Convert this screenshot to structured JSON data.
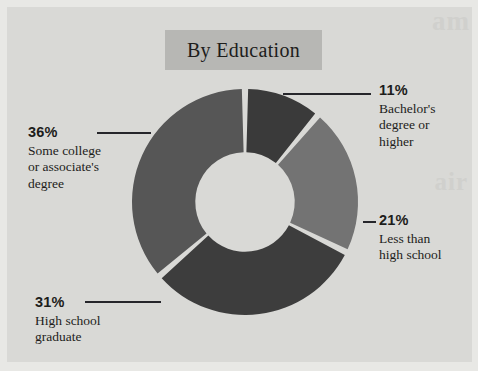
{
  "figure": {
    "title": "By Education",
    "background_color": "#d9d9d6",
    "title_band_color": "#b7b7b4",
    "ghost_text_1": "am",
    "ghost_text_2": "air"
  },
  "chart_data": {
    "type": "pie",
    "variant": "donut",
    "title": "By Education",
    "xlabel": "",
    "ylabel": "",
    "units": "percent",
    "total": 99,
    "start_angle_deg": 0,
    "direction": "clockwise",
    "inner_radius_ratio": 0.44,
    "legend": "none (direct labels with leader lines)",
    "categories": [
      "Bachelor's degree or higher",
      "Less than high school",
      "High school graduate",
      "Some college or associate's degree"
    ],
    "values": [
      11,
      21,
      31,
      36
    ],
    "colors": [
      "#3a3a3a",
      "#737373",
      "#3d3d3d",
      "#565656"
    ],
    "slices": [
      {
        "label": "Bachelor's degree or higher",
        "label_lines": "Bachelor's\ndegree or\nhigher",
        "value": 11,
        "value_text": "11%",
        "color": "#3a3a3a",
        "label_position": "right-top"
      },
      {
        "label": "Less than high school",
        "label_lines": "Less than\nhigh school",
        "value": 21,
        "value_text": "21%",
        "color": "#737373",
        "label_position": "right-middle"
      },
      {
        "label": "High school graduate",
        "label_lines": "High school\ngraduate",
        "value": 31,
        "value_text": "31%",
        "color": "#3d3d3d",
        "label_position": "left-bottom"
      },
      {
        "label": "Some college or associate's degree",
        "label_lines": "Some college\nor associate's\ndegree",
        "value": 36,
        "value_text": "36%",
        "color": "#565656",
        "label_position": "left-top"
      }
    ]
  }
}
